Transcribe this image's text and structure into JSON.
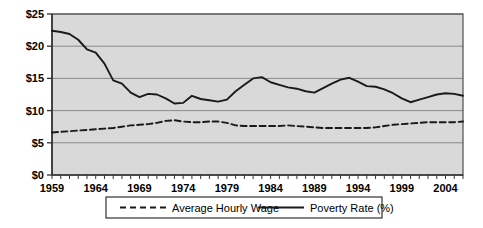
{
  "chart_data": {
    "type": "line",
    "title": "",
    "xlabel": "",
    "ylabel": "",
    "grid": true,
    "legend_position": "bottom",
    "xlim": [
      1959,
      2006
    ],
    "ylim": [
      0,
      25
    ],
    "y_ticks": [
      "$0",
      "$5",
      "$10",
      "$15",
      "$20",
      "$25"
    ],
    "y_tick_values": [
      0,
      5,
      10,
      15,
      20,
      25
    ],
    "x_ticks": [
      "1959",
      "1964",
      "1969",
      "1974",
      "1979",
      "1984",
      "1989",
      "1994",
      "1999",
      "2004"
    ],
    "x_tick_values": [
      1959,
      1964,
      1969,
      1974,
      1979,
      1984,
      1989,
      1994,
      1999,
      2004
    ],
    "x": [
      1959,
      1960,
      1961,
      1962,
      1963,
      1964,
      1965,
      1966,
      1967,
      1968,
      1969,
      1970,
      1971,
      1972,
      1973,
      1974,
      1975,
      1976,
      1977,
      1978,
      1979,
      1980,
      1981,
      1982,
      1983,
      1984,
      1985,
      1986,
      1987,
      1988,
      1989,
      1990,
      1991,
      1992,
      1993,
      1994,
      1995,
      1996,
      1997,
      1998,
      1999,
      2000,
      2001,
      2002,
      2003,
      2004,
      2005,
      2006
    ],
    "series": [
      {
        "name": "Average Hourly Wage",
        "style": "dashed",
        "color": "#1a1a1a",
        "values": [
          6.6,
          6.7,
          6.8,
          6.9,
          7.0,
          7.1,
          7.2,
          7.3,
          7.5,
          7.7,
          7.8,
          7.9,
          8.1,
          8.4,
          8.5,
          8.3,
          8.2,
          8.2,
          8.3,
          8.3,
          8.1,
          7.7,
          7.6,
          7.6,
          7.6,
          7.6,
          7.6,
          7.7,
          7.6,
          7.5,
          7.4,
          7.3,
          7.3,
          7.3,
          7.3,
          7.3,
          7.3,
          7.4,
          7.6,
          7.8,
          7.9,
          8.0,
          8.1,
          8.2,
          8.2,
          8.2,
          8.2,
          8.3
        ]
      },
      {
        "name": "Poverty Rate (%)",
        "style": "solid",
        "color": "#1a1a1a",
        "values": [
          22.4,
          22.2,
          21.9,
          21.0,
          19.5,
          19.0,
          17.3,
          14.7,
          14.2,
          12.8,
          12.1,
          12.6,
          12.5,
          11.9,
          11.1,
          11.2,
          12.3,
          11.8,
          11.6,
          11.4,
          11.7,
          13.0,
          14.0,
          15.0,
          15.2,
          14.4,
          14.0,
          13.6,
          13.4,
          13.0,
          12.8,
          13.5,
          14.2,
          14.8,
          15.1,
          14.5,
          13.8,
          13.7,
          13.3,
          12.7,
          11.9,
          11.3,
          11.7,
          12.1,
          12.5,
          12.7,
          12.6,
          12.3
        ]
      }
    ]
  },
  "legend": {
    "items": [
      {
        "label": "Average Hourly Wage",
        "style": "dashed"
      },
      {
        "label": "Poverty Rate (%)",
        "style": "solid"
      }
    ]
  },
  "colors": {
    "plot_background": "#d9d9d9",
    "grid": "#808080",
    "axis": "#4d4d4d",
    "line": "#1a1a1a",
    "page_background": "#ffffff"
  }
}
